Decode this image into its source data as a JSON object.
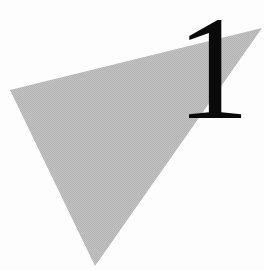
{
  "graphic": {
    "numeral": "1",
    "numeral_color": "#0a0a0a",
    "triangle": {
      "fill": "#bcbcbc",
      "points": "10,90 262,28 95,266"
    },
    "background": "#fdfdfd"
  }
}
